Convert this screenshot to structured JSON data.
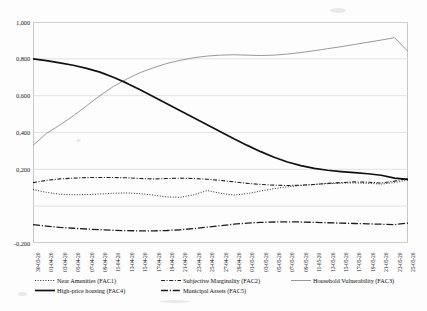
{
  "chart_data": {
    "type": "line",
    "title": "",
    "subtitle": "",
    "xlabel": "",
    "ylabel": "",
    "ylim": [
      -0.2,
      1.0
    ],
    "yticks": [
      "1,000",
      "0,800",
      "0,600",
      "0,400",
      "0,200",
      "0,000",
      "-0,200"
    ],
    "ytick_values": [
      1.0,
      0.8,
      0.6,
      0.4,
      0.2,
      0.0,
      -0.2
    ],
    "ytick_labels_visible": [
      "1,000",
      "0,800",
      "0,600",
      "0,400",
      "0,200",
      "",
      "-0,200"
    ],
    "grid": true,
    "grid_axis": "y",
    "legend_position": "below",
    "categories": [
      "30-03-20",
      "01-04-20",
      "03-04-20",
      "05-04-20",
      "07-04-20",
      "09-04-20",
      "11-04-20",
      "13-04-20",
      "15-04-20",
      "17-04-20",
      "19-04-20",
      "21-04-20",
      "23-04-20",
      "25-04-20",
      "27-04-20",
      "29-04-20",
      "01-05-20",
      "03-05-20",
      "05-05-20",
      "07-05-20",
      "09-05-20",
      "11-05-20",
      "13-05-20",
      "15-05-20",
      "17-05-20",
      "19-05-20",
      "21-05-20",
      "23-05-20",
      "25-05-20"
    ],
    "series": [
      {
        "name": "Near Amenities (FAC1)",
        "key": "FAC1",
        "style": "dotted",
        "color": "#2b2b2b",
        "values": [
          0.09,
          0.075,
          0.065,
          0.062,
          0.063,
          0.066,
          0.07,
          0.072,
          0.068,
          0.06,
          0.05,
          0.048,
          0.062,
          0.085,
          0.07,
          0.06,
          0.068,
          0.082,
          0.095,
          0.105,
          0.112,
          0.118,
          0.122,
          0.125,
          0.126,
          0.124,
          0.12,
          0.128,
          0.142
        ]
      },
      {
        "name": "Subjective Marginality (FAC2)",
        "key": "FAC2",
        "style": "dash-dot",
        "color": "#222222",
        "values": [
          0.128,
          0.14,
          0.148,
          0.152,
          0.155,
          0.156,
          0.156,
          0.154,
          0.15,
          0.148,
          0.15,
          0.152,
          0.15,
          0.146,
          0.14,
          0.132,
          0.124,
          0.118,
          0.114,
          0.112,
          0.114,
          0.118,
          0.124,
          0.128,
          0.132,
          0.13,
          0.126,
          0.136,
          0.152
        ]
      },
      {
        "name": "Household Vulnerability (FAC3)",
        "key": "FAC3",
        "style": "solid-thin",
        "color": "#8c8c8c",
        "values": [
          0.33,
          0.395,
          0.44,
          0.49,
          0.545,
          0.6,
          0.65,
          0.69,
          0.725,
          0.752,
          0.775,
          0.792,
          0.806,
          0.815,
          0.82,
          0.822,
          0.82,
          0.818,
          0.82,
          0.826,
          0.834,
          0.844,
          0.855,
          0.866,
          0.878,
          0.89,
          0.902,
          0.915,
          0.84
        ]
      },
      {
        "name": "High-price housing (FAC4)",
        "key": "FAC4",
        "style": "solid-thick",
        "color": "#101010",
        "values": [
          0.8,
          0.79,
          0.778,
          0.765,
          0.748,
          0.728,
          0.7,
          0.668,
          0.632,
          0.594,
          0.556,
          0.518,
          0.48,
          0.442,
          0.404,
          0.366,
          0.33,
          0.296,
          0.266,
          0.24,
          0.22,
          0.205,
          0.195,
          0.188,
          0.182,
          0.176,
          0.168,
          0.152,
          0.146
        ]
      },
      {
        "name": "Municipal Assets (FAC5)",
        "key": "FAC5",
        "style": "long-dash-dot",
        "color": "#1c1c1c",
        "values": [
          -0.1,
          -0.108,
          -0.115,
          -0.12,
          -0.124,
          -0.128,
          -0.131,
          -0.133,
          -0.134,
          -0.134,
          -0.132,
          -0.128,
          -0.122,
          -0.114,
          -0.106,
          -0.098,
          -0.092,
          -0.088,
          -0.086,
          -0.085,
          -0.086,
          -0.088,
          -0.09,
          -0.092,
          -0.094,
          -0.096,
          -0.098,
          -0.1,
          -0.092
        ]
      }
    ]
  },
  "legend": {
    "rows": [
      [
        {
          "label": "Near Amenities (FAC1)",
          "style": "dotted"
        },
        {
          "label": "Subjective Marginality (FAC2)",
          "style": "dash-dot"
        },
        {
          "label": "Household Vulnerability (FAC3)",
          "style": "solid-thin"
        }
      ],
      [
        {
          "label": "High-price housing (FAC4)",
          "style": "solid-thick"
        },
        {
          "label": "Municipal Assets (FAC5)",
          "style": "long-dash-dot"
        }
      ]
    ]
  }
}
